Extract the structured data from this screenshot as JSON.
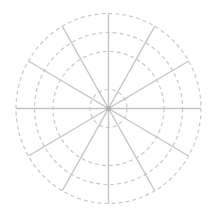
{
  "chart_data": {
    "type": "polar",
    "title": "",
    "xlabel": "",
    "ylabel": "",
    "series": [],
    "grid": true,
    "legend": null,
    "spokes": 12,
    "spoke_angle_step_deg": 30,
    "rings": 4,
    "ring_radii_fraction": [
      0.2,
      0.6,
      0.8,
      1.0
    ],
    "tick_labels": []
  },
  "style": {
    "background": "#ffffff",
    "spoke_color": "#c4c4c4",
    "ring_color": "#c8c8c8",
    "center_color": "#b0b0b0"
  },
  "geometry": {
    "cx": 108.5,
    "cy": 108.5,
    "rx": 92.5,
    "ry": 95
  }
}
